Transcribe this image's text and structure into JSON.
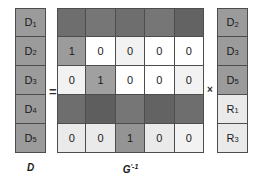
{
  "figure": {
    "caption_left": "D",
    "caption_matrix_base": "G",
    "caption_matrix_sup": "'-1",
    "operator_equals": "=",
    "operator_multiply": "×"
  },
  "colors": {
    "medium_gray": "#9b9b9b",
    "light_gray": "#eaeaea",
    "dark_gray": "#6e6e6e",
    "white": "#ffffff",
    "border": "#4d4d4d",
    "text": "#1a1a1a"
  },
  "left_vector": {
    "name": "D",
    "cells": [
      {
        "base": "D",
        "sub": "1",
        "shade": "sh-gray"
      },
      {
        "base": "D",
        "sub": "2",
        "shade": "sh-gray"
      },
      {
        "base": "D",
        "sub": "3",
        "shade": "sh-gray"
      },
      {
        "base": "D",
        "sub": "4",
        "shade": "sh-gray"
      },
      {
        "base": "D",
        "sub": "5",
        "shade": "sh-gray"
      }
    ]
  },
  "matrix": {
    "name": "G'-1",
    "rows": 5,
    "cols": 5,
    "cells": [
      [
        {
          "value": "",
          "shade": "sh-dark"
        },
        {
          "value": "",
          "shade": "sh-dark3"
        },
        {
          "value": "",
          "shade": "sh-dark"
        },
        {
          "value": "",
          "shade": "sh-dark3"
        },
        {
          "value": "",
          "shade": "sh-dark2"
        }
      ],
      [
        {
          "value": "1",
          "shade": "sh-gray"
        },
        {
          "value": "0",
          "shade": "sh-white"
        },
        {
          "value": "0",
          "shade": "sh-offwhite"
        },
        {
          "value": "0",
          "shade": "sh-white"
        },
        {
          "value": "0",
          "shade": "sh-white"
        }
      ],
      [
        {
          "value": "0",
          "shade": "sh-offwhite"
        },
        {
          "value": "1",
          "shade": "sh-gray3"
        },
        {
          "value": "0",
          "shade": "sh-white"
        },
        {
          "value": "0",
          "shade": "sh-white"
        },
        {
          "value": "0",
          "shade": "sh-offwhite"
        }
      ],
      [
        {
          "value": "",
          "shade": "sh-dark"
        },
        {
          "value": "",
          "shade": "sh-dark4"
        },
        {
          "value": "",
          "shade": "sh-dark3"
        },
        {
          "value": "",
          "shade": "sh-dark2"
        },
        {
          "value": "",
          "shade": "sh-dark"
        }
      ],
      [
        {
          "value": "0",
          "shade": "sh-light"
        },
        {
          "value": "0",
          "shade": "sh-light"
        },
        {
          "value": "1",
          "shade": "sh-gray2"
        },
        {
          "value": "0",
          "shade": "sh-light"
        },
        {
          "value": "0",
          "shade": "sh-offwhite"
        }
      ]
    ]
  },
  "right_vector": {
    "cells": [
      {
        "base": "D",
        "sub": "2",
        "shade": "sh-gray"
      },
      {
        "base": "D",
        "sub": "3",
        "shade": "sh-gray"
      },
      {
        "base": "D",
        "sub": "5",
        "shade": "sh-gray"
      },
      {
        "base": "R",
        "sub": "1",
        "shade": "sh-light"
      },
      {
        "base": "R",
        "sub": "3",
        "shade": "sh-light"
      }
    ]
  }
}
